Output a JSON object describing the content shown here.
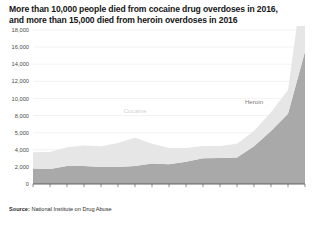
{
  "title": {
    "line1": "More than 10,000 people died from cocaine drug overdoses in 2016,",
    "line2": "and more than 15,000 died from heroin overdoses in 2016"
  },
  "source": {
    "prefix": "Source:",
    "text": " National Institute on Drug Abuse"
  },
  "colors": {
    "heroin": "#a9a9a9",
    "cocaine": "#e6e6e6",
    "grid": "#e4e4e4",
    "axis": "#4a4a4a",
    "text": "#1b1b1b"
  },
  "chart_data": {
    "type": "area",
    "stacked": true,
    "title": "More than 10,000 people died from cocaine drug overdoses in 2016, and more than 15,000 died from heroin overdoses in 2016",
    "subtitle": "",
    "xlabel": "",
    "ylabel": "",
    "x": [
      2000,
      2001,
      2002,
      2003,
      2004,
      2005,
      2006,
      2007,
      2008,
      2009,
      2010,
      2011,
      2012,
      2013,
      2014,
      2015,
      2016
    ],
    "xtick_labels": [
      "2000",
      "'01",
      "'02",
      "'03",
      "'04",
      "'05",
      "'06",
      "'07",
      "'08",
      "'09",
      "'10",
      "'11",
      "'12",
      "'13",
      "'14",
      "'15",
      "2016"
    ],
    "ytick_labels": [
      "0",
      "2,000",
      "4,000",
      "5,000",
      "8,000",
      "10,000",
      "12,000",
      "14,000",
      "16,000",
      "18,000"
    ],
    "ytick_values": [
      0,
      2000,
      4000,
      6000,
      8000,
      10000,
      12000,
      14000,
      16000,
      18000
    ],
    "ylim": [
      0,
      18000
    ],
    "xlim": [
      2000,
      2016
    ],
    "grid": true,
    "legend_position": "inline-annotation",
    "series": [
      {
        "name": "Heroin",
        "color": "#a9a9a9",
        "label_x": 2013,
        "label_y": 9400,
        "values": [
          1800,
          1750,
          2100,
          2100,
          2000,
          2000,
          2100,
          2400,
          2300,
          2600,
          3000,
          3050,
          3100,
          4400,
          6200,
          8200,
          15500
        ]
      },
      {
        "name": "Cocaine",
        "color": "#e6e6e6",
        "label_x": 2006,
        "label_y": 8300,
        "values": [
          1900,
          2000,
          2200,
          2400,
          2400,
          2800,
          3300,
          2300,
          1900,
          1600,
          1450,
          1400,
          1600,
          1800,
          2200,
          2800,
          10000
        ]
      }
    ],
    "totals": [
      3700,
      3750,
      4300,
      4500,
      4400,
      4800,
      7400,
      6700,
      5700,
      5000,
      4600,
      4500,
      4700,
      6200,
      8400,
      11000,
      25500
    ],
    "annotations": [
      {
        "text": "Cocaine",
        "x": 2006,
        "y": 8300,
        "color": "#d2d2d2"
      },
      {
        "text": "Heroin",
        "x": 2013,
        "y": 9400,
        "color": "#7c7c7c"
      }
    ]
  }
}
